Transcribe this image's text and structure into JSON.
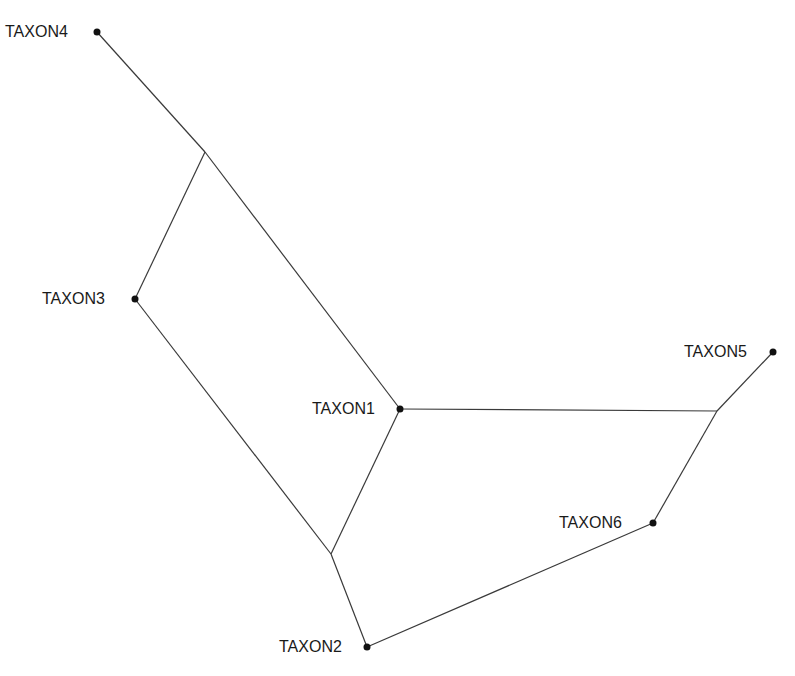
{
  "diagram": {
    "type": "phylogenetic-network",
    "taxa": [
      {
        "id": "t1",
        "label": "TAXON1",
        "x": 400,
        "y": 409,
        "label_x": 312,
        "label_y": 401
      },
      {
        "id": "t2",
        "label": "TAXON2",
        "x": 367,
        "y": 647,
        "label_x": 279,
        "label_y": 639
      },
      {
        "id": "t3",
        "label": "TAXON3",
        "x": 135,
        "y": 299,
        "label_x": 42,
        "label_y": 291
      },
      {
        "id": "t4",
        "label": "TAXON4",
        "x": 97,
        "y": 32,
        "label_x": 5,
        "label_y": 24
      },
      {
        "id": "t5",
        "label": "TAXON5",
        "x": 773,
        "y": 352,
        "label_x": 684,
        "label_y": 344
      },
      {
        "id": "t6",
        "label": "TAXON6",
        "x": 653,
        "y": 523,
        "label_x": 559,
        "label_y": 515
      }
    ],
    "internal_nodes": [
      {
        "id": "n1",
        "x": 205,
        "y": 152
      },
      {
        "id": "n2",
        "x": 331,
        "y": 554
      },
      {
        "id": "n3",
        "x": 717,
        "y": 411
      }
    ],
    "edges": [
      [
        "t4",
        "n1"
      ],
      [
        "n1",
        "t1"
      ],
      [
        "n1",
        "t3"
      ],
      [
        "t3",
        "n2"
      ],
      [
        "n2",
        "t1"
      ],
      [
        "n2",
        "t2"
      ],
      [
        "t1",
        "n3"
      ],
      [
        "n3",
        "t5"
      ],
      [
        "n3",
        "t6"
      ],
      [
        "t6",
        "t2"
      ]
    ]
  }
}
